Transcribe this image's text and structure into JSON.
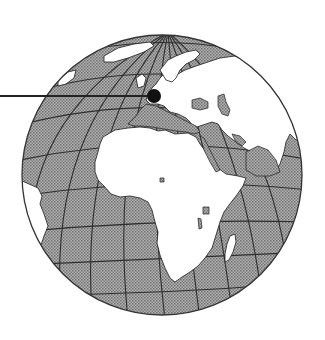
{
  "figure": {
    "type": "orthographic-globe",
    "view_center": "Europe / Africa",
    "colors": {
      "background": "#ffffff",
      "ocean": "#9a9a9a",
      "land": "#ffffff",
      "gridline": "#2e2e2e",
      "outline": "#333333",
      "marker": "#111111"
    },
    "globe": {
      "cx": 162,
      "cy": 175,
      "r": 140
    },
    "marker": {
      "label": "location-marker",
      "region": "Central Europe",
      "x": 154,
      "y": 96,
      "r": 7,
      "leader_line": {
        "x1": 0,
        "y1": 96,
        "x2": 150,
        "y2": 96
      }
    },
    "landmasses": [
      "Africa",
      "Europe",
      "Asia",
      "Arabian Peninsula",
      "Greenland",
      "Scandinavia",
      "South America (east edge)",
      "Madagascar",
      "India (west edge)"
    ]
  }
}
